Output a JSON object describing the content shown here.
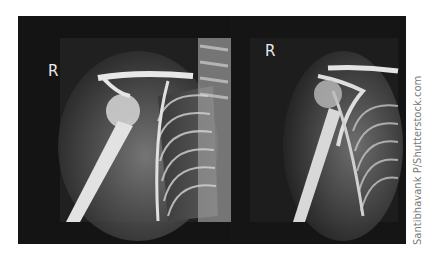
{
  "image": {
    "description": "Two side-by-side right shoulder X-ray radiographs on a black background",
    "panels": [
      {
        "id": "left",
        "marker": "R",
        "subject": "right shoulder X-ray with humerus, clavicle, scapula and ribs"
      },
      {
        "id": "right",
        "marker": "R",
        "subject": "right shoulder X-ray, oblique/scapular view"
      }
    ],
    "credit": "Santibhavank P/Shutterstock.com",
    "colors": {
      "background": "#ffffff",
      "frame": "#161616",
      "bone": "#e6e6e6",
      "soft_tissue": "#6a6a6a"
    }
  }
}
